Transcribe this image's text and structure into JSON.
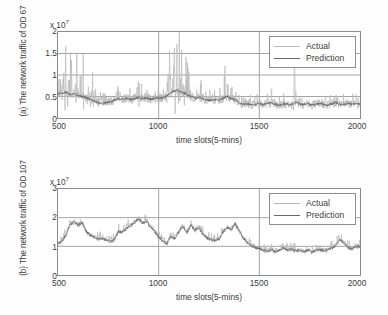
{
  "figure": {
    "background": "#ffffff",
    "axis_color": "#8a8a8a",
    "grid_color": "#9a9a9a",
    "actual_color": "#b9b9b9",
    "prediction_color": "#6a6a6a"
  },
  "panels": [
    {
      "id": "a",
      "ylabel": "(a) The network traffic of OD 67",
      "exp_base": "x 10",
      "exp_power": "7",
      "xlabel": "time slots(5-mins)",
      "yticks": [
        "0",
        "0.5",
        "1",
        "1.5",
        "2"
      ],
      "xticks": [
        "500",
        "1000",
        "1500",
        "2000"
      ],
      "legend": [
        {
          "label": "Actual",
          "color": "#b9b9b9"
        },
        {
          "label": "Prediction",
          "color": "#6a6a6a"
        }
      ]
    },
    {
      "id": "b",
      "ylabel": "(b) The network traffic of OD 107",
      "exp_base": "x 10",
      "exp_power": "7",
      "xlabel": "time slots(5-mins)",
      "yticks": [
        "0",
        "1",
        "2",
        "3"
      ],
      "xticks": [
        "500",
        "1000",
        "1500",
        "2000"
      ],
      "legend": [
        {
          "label": "Actual",
          "color": "#b9b9b9"
        },
        {
          "label": "Prediction",
          "color": "#6a6a6a"
        }
      ]
    }
  ],
  "chart_data": [
    {
      "type": "line",
      "title": "(a) The network traffic of OD 67",
      "xlabel": "time slots(5-mins)",
      "ylabel": "(a) The network traffic of OD 67",
      "y_multiplier": "x 10^7",
      "xlim": [
        500,
        2000
      ],
      "ylim": [
        0,
        2
      ],
      "xticks": [
        500,
        1000,
        1500,
        2000
      ],
      "yticks": [
        0,
        0.5,
        1,
        1.5,
        2
      ],
      "grid": true,
      "legend_position": "top-right",
      "series": [
        {
          "name": "Actual",
          "color": "#b9b9b9",
          "note": "Highly spiky measured traffic; baseline ~0.45 with frequent bursts to 0.8-1.7 between slots 500-700, moderate 0.5-1.2 bursts 700-1000, elevated burst cluster 1040-1160 reaching 1.6-1.7, sporadic 0.7-1.2 spikes 1160-1400, then a lower regime after slot 1500 with baseline ~0.33 and occasional spikes to 0.75-1.0.",
          "x": [
            500,
            520,
            540,
            560,
            580,
            600,
            620,
            640,
            660,
            680,
            700,
            720,
            740,
            760,
            780,
            800,
            820,
            840,
            860,
            880,
            900,
            920,
            940,
            960,
            980,
            1000,
            1020,
            1040,
            1060,
            1080,
            1100,
            1120,
            1140,
            1160,
            1180,
            1200,
            1220,
            1240,
            1260,
            1280,
            1300,
            1320,
            1340,
            1360,
            1380,
            1400,
            1420,
            1440,
            1460,
            1480,
            1500,
            1520,
            1540,
            1560,
            1580,
            1600,
            1620,
            1640,
            1660,
            1680,
            1700,
            1720,
            1740,
            1760,
            1780,
            1800,
            1820,
            1840,
            1860,
            1880,
            1900,
            1920,
            1940,
            1960,
            1980,
            2000
          ],
          "values": [
            0.62,
            1.05,
            1.52,
            0.95,
            1.48,
            0.78,
            1.32,
            0.7,
            0.88,
            0.6,
            0.55,
            0.45,
            0.52,
            0.41,
            0.58,
            0.72,
            0.5,
            0.64,
            0.46,
            0.58,
            0.95,
            0.52,
            0.73,
            0.48,
            0.6,
            0.88,
            0.55,
            0.8,
            1.24,
            1.7,
            1.35,
            1.18,
            0.92,
            0.66,
            0.58,
            1.0,
            0.7,
            0.52,
            0.44,
            0.62,
            0.5,
            0.73,
            1.05,
            0.6,
            0.52,
            0.4,
            0.35,
            0.38,
            0.3,
            0.33,
            0.36,
            0.31,
            0.42,
            0.78,
            0.34,
            0.3,
            0.44,
            0.35,
            0.32,
            0.96,
            0.38,
            0.33,
            0.42,
            0.31,
            0.36,
            0.52,
            0.33,
            0.3,
            0.38,
            0.72,
            0.34,
            0.31,
            0.4,
            0.33,
            0.37,
            0.35
          ]
        },
        {
          "name": "Prediction",
          "color": "#6a6a6a",
          "note": "Smoothed predicted traffic tracking the actual mean; ~0.5-0.6 for slots 500-650, dipping to ~0.33-0.40 near 700-780, hovering 0.42-0.52 through 1000, rising to ~0.60-0.66 near 1080-1130, then settling to ~0.30-0.40 after slot 1500.",
          "x": [
            500,
            520,
            540,
            560,
            580,
            600,
            620,
            640,
            660,
            680,
            700,
            720,
            740,
            760,
            780,
            800,
            820,
            840,
            860,
            880,
            900,
            920,
            940,
            960,
            980,
            1000,
            1020,
            1040,
            1060,
            1080,
            1100,
            1120,
            1140,
            1160,
            1180,
            1200,
            1220,
            1240,
            1260,
            1280,
            1300,
            1320,
            1340,
            1360,
            1380,
            1400,
            1420,
            1440,
            1460,
            1480,
            1500,
            1520,
            1540,
            1560,
            1580,
            1600,
            1620,
            1640,
            1660,
            1680,
            1700,
            1720,
            1740,
            1760,
            1780,
            1800,
            1820,
            1840,
            1860,
            1880,
            1900,
            1920,
            1940,
            1960,
            1980,
            2000
          ],
          "values": [
            0.58,
            0.56,
            0.6,
            0.55,
            0.57,
            0.52,
            0.5,
            0.47,
            0.44,
            0.4,
            0.36,
            0.34,
            0.36,
            0.38,
            0.41,
            0.45,
            0.44,
            0.46,
            0.43,
            0.45,
            0.48,
            0.45,
            0.47,
            0.44,
            0.45,
            0.47,
            0.46,
            0.52,
            0.58,
            0.64,
            0.63,
            0.6,
            0.55,
            0.5,
            0.46,
            0.48,
            0.45,
            0.42,
            0.4,
            0.43,
            0.41,
            0.46,
            0.5,
            0.45,
            0.42,
            0.36,
            0.32,
            0.33,
            0.3,
            0.31,
            0.33,
            0.31,
            0.34,
            0.36,
            0.32,
            0.3,
            0.33,
            0.32,
            0.31,
            0.36,
            0.33,
            0.31,
            0.34,
            0.3,
            0.32,
            0.35,
            0.31,
            0.3,
            0.33,
            0.36,
            0.32,
            0.31,
            0.34,
            0.32,
            0.33,
            0.32
          ]
        }
      ]
    },
    {
      "type": "line",
      "title": "(b) The network traffic of OD 107",
      "xlabel": "time slots(5-mins)",
      "ylabel": "(b) The network traffic of OD 107",
      "y_multiplier": "x 10^7",
      "xlim": [
        500,
        2000
      ],
      "ylim": [
        0,
        3
      ],
      "xticks": [
        500,
        1000,
        1500,
        2000
      ],
      "yticks": [
        0,
        1,
        2,
        3
      ],
      "grid": true,
      "legend_position": "top-right",
      "series": [
        {
          "name": "Actual",
          "color": "#b9b9b9",
          "note": "Measured traffic starting ~1.1, rising to a ~1.9-2.0 hump near slots 560-620, settling ~1.2-1.4 through 780, a broad elevated band 800-950 peaking ~2.1 near slot 900, fluctuating 1.2-1.8 from 1000-1250, a second peak ~1.9 near 1380-1420, then dropping to a ~0.75-0.95 regime after slot 1500 with a final rise to ~1.3 near 1900.",
          "x": [
            500,
            520,
            540,
            560,
            580,
            600,
            620,
            640,
            660,
            680,
            700,
            720,
            740,
            760,
            780,
            800,
            820,
            840,
            860,
            880,
            900,
            920,
            940,
            960,
            980,
            1000,
            1020,
            1040,
            1060,
            1080,
            1100,
            1120,
            1140,
            1160,
            1180,
            1200,
            1220,
            1240,
            1260,
            1280,
            1300,
            1320,
            1340,
            1360,
            1380,
            1400,
            1420,
            1440,
            1460,
            1480,
            1500,
            1520,
            1540,
            1560,
            1580,
            1600,
            1620,
            1640,
            1660,
            1680,
            1700,
            1720,
            1740,
            1760,
            1780,
            1800,
            1820,
            1840,
            1860,
            1880,
            1900,
            1920,
            1940,
            1960,
            1980,
            2000
          ],
          "values": [
            1.12,
            1.2,
            1.45,
            1.85,
            1.95,
            1.8,
            1.92,
            1.55,
            1.4,
            1.35,
            1.28,
            1.3,
            1.22,
            1.18,
            1.25,
            1.6,
            1.52,
            1.7,
            1.78,
            1.92,
            2.12,
            1.86,
            1.95,
            1.7,
            1.55,
            1.35,
            1.18,
            1.05,
            1.42,
            1.3,
            1.55,
            1.78,
            1.52,
            1.82,
            1.6,
            1.72,
            1.45,
            1.3,
            1.22,
            1.18,
            1.28,
            1.55,
            1.72,
            1.62,
            1.9,
            1.55,
            1.3,
            1.12,
            1.0,
            0.95,
            0.92,
            0.85,
            0.8,
            0.88,
            0.78,
            0.84,
            0.95,
            0.86,
            0.9,
            0.82,
            0.88,
            0.8,
            0.86,
            0.78,
            0.84,
            0.9,
            0.82,
            0.88,
            0.95,
            1.05,
            1.3,
            1.12,
            0.95,
            0.88,
            1.02,
            1.0
          ]
        },
        {
          "name": "Prediction",
          "color": "#6a6a6a",
          "note": "Smoothed prediction closely following the actual mean curve, slightly damping the extremes; ~1.1 at slot 500, ~1.8 at the 580-620 hump, ~1.2-1.3 mid band, ~1.95 near slot 900, ~1.5-1.7 through 1200, ~1.75 near 1400, then ~0.85 after slot 1500 with a rise to ~1.2 near 1900.",
          "x": [
            500,
            520,
            540,
            560,
            580,
            600,
            620,
            640,
            660,
            680,
            700,
            720,
            740,
            760,
            780,
            800,
            820,
            840,
            860,
            880,
            900,
            920,
            940,
            960,
            980,
            1000,
            1020,
            1040,
            1060,
            1080,
            1100,
            1120,
            1140,
            1160,
            1180,
            1200,
            1220,
            1240,
            1260,
            1280,
            1300,
            1320,
            1340,
            1360,
            1380,
            1400,
            1420,
            1440,
            1460,
            1480,
            1500,
            1520,
            1540,
            1560,
            1580,
            1600,
            1620,
            1640,
            1660,
            1680,
            1700,
            1720,
            1740,
            1760,
            1780,
            1800,
            1820,
            1840,
            1860,
            1880,
            1900,
            1920,
            1940,
            1960,
            1980,
            2000
          ],
          "values": [
            1.1,
            1.18,
            1.4,
            1.76,
            1.86,
            1.74,
            1.82,
            1.52,
            1.38,
            1.32,
            1.26,
            1.28,
            1.21,
            1.17,
            1.23,
            1.52,
            1.48,
            1.64,
            1.72,
            1.84,
            1.98,
            1.8,
            1.88,
            1.66,
            1.52,
            1.33,
            1.19,
            1.08,
            1.36,
            1.28,
            1.5,
            1.7,
            1.48,
            1.74,
            1.56,
            1.66,
            1.42,
            1.29,
            1.22,
            1.19,
            1.26,
            1.5,
            1.66,
            1.58,
            1.8,
            1.52,
            1.3,
            1.14,
            1.02,
            0.96,
            0.93,
            0.87,
            0.83,
            0.89,
            0.81,
            0.86,
            0.94,
            0.87,
            0.9,
            0.84,
            0.88,
            0.82,
            0.87,
            0.8,
            0.85,
            0.89,
            0.84,
            0.89,
            0.94,
            1.03,
            1.24,
            1.1,
            0.96,
            0.9,
            1.0,
            0.99
          ]
        }
      ]
    }
  ]
}
